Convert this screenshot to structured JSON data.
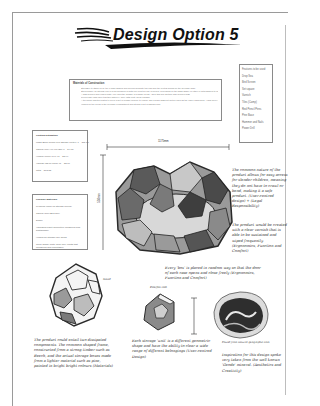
{
  "page": {
    "title": "Design Option 5"
  },
  "materials": {
    "heading": "Materials of Construction",
    "items": [
      "Stool/Box to stand on by the 7 main shapes and around separate two pad and the central blocks for the Teenage chair",
      "Stood simply on internal end or in an inclusion of both one point for use in pieces, depending on the basic shape of either or both shapes to use it",
      "A slab wooden and edged plate; one uses the surface in a single mesh - as in this pod another also wooden slab",
      "Pieces and ends used together with PVA glue (with coat, Clear varnish)",
      "A trio sides' inserted plates to cover a set of design (closed) to ensure and a foam glass set but so used as the upper framework - each piece and ball sits, also it's slab shapes on its surface with the ring",
      "Hinges for the doors of the Teenage compartment and storing a set pegboard wall"
    ]
  },
  "features": {
    "heading": "Features to be used:",
    "items": [
      "Drop Sea",
      "Bird Screen",
      "Set square",
      "Varnish",
      "Tiles (Camp)",
      "Red Pencil Pens",
      "Pine Base",
      "Hammer and Nails",
      "Power Drill"
    ]
  },
  "costing": {
    "heading": "Costing Estimation",
    "rows": [
      "Mass Birch 16mm (Per Square Meter): 1 = £11.10",
      "Jarrold (W0+H0+L0)(3m) 1 = £4.13",
      "Hinges (Piece of 6) x1 = £3.99",
      "Varnish (£3.60 each) x1 = £3.60",
      "Total = £13.53"
    ]
  },
  "possible_materials": {
    "heading": "Possible Materials:",
    "rows": [
      "Plywood (6mm for storage boxes)",
      "Jarrold (Jelly/Bird box)",
      "Dowel",
      "Varnishes paint (Reflective measures and sustainable)",
      "Hinges for storage box doors",
      "Clear glossy mate (seal coil) (Parts that measured and reflectable)"
    ]
  },
  "dimensions": {
    "width_label": "1175mm",
    "height_label": "550mm",
    "small_height_label": "350mm",
    "small_width_label": "200mm",
    "sketch_height_label": "210mm"
  },
  "sketch_labels": {
    "stand_label": "Stand",
    "pole_label": "Pole",
    "pole_tab_label": "Pole/flat slab",
    "geode_caption": "Found from natural geographic.com"
  },
  "notes": {
    "n1": "The common nature of the product allows for easy access for slender children, meaning they do not have to crawl or bend, making it a safe product. (User-centred design) + (Legal Responsibility)",
    "n2": "The product would be created with a clear varnish that is able to be sustained and wiped frequently. (Ergonomics, Function and Comfort)",
    "n3": "Every 'box' is placed in random way so that the door of each case opens and close freely (Ergonomics, Function and Comfort)",
    "n4": "The product could entail two dissipated components. The common shaped frame, constructed from a strong timber such as Beech, and the actual storage boxes made from a lighter material such as pine, painted in bright bright colours (Materials)",
    "n5": "Each storage 'unit' is a different geometric shape and have the ability to clear a wide range of different belongings (User-centred Design)",
    "n6": "Inspiration for this design spoke very taken from the well known 'Geode' mineral. (Aesthetics and Creativity)"
  },
  "colors": {
    "paper": "#ffffff",
    "ink": "#222222",
    "frame_border": "#9a9a9a",
    "sketch_dark": "#3a3a3a",
    "sketch_mid": "#8a8a8a",
    "sketch_light": "#cfcfcf"
  }
}
